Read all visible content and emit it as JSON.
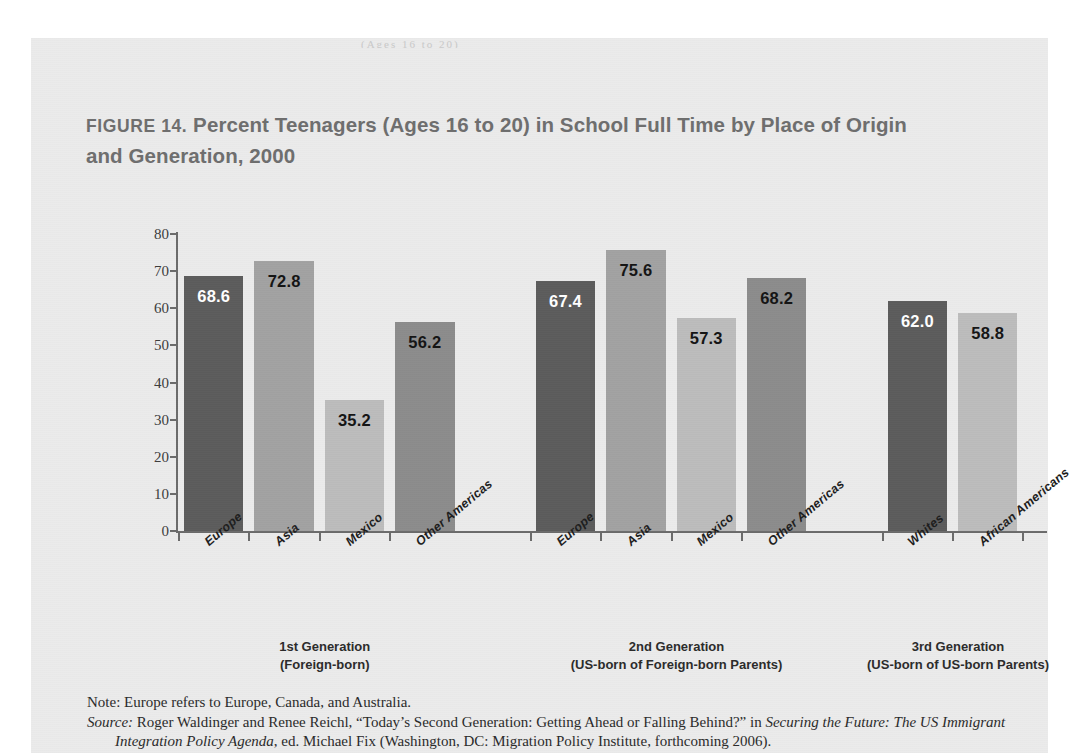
{
  "page": {
    "top_sliver_text": "(Ages 16 to 20)"
  },
  "figure": {
    "label": "FIGURE 14.",
    "title_rest": " Percent Teenagers (Ages 16 to 20) in School Full Time by Place of Origin and Generation, 2000",
    "title_full": "FIGURE 14. Percent Teenagers (Ages 16 to 20) in School Full Time by Place of Origin and Generation, 2000"
  },
  "notes": {
    "note_label": "Note:",
    "note_text": " Europe refers to Europe, Canada, and Australia.",
    "source_label": "Source:",
    "source_text_1": " Roger Waldinger and Renee Reichl, “Today’s Second Generation: Getting Ahead or Falling Behind?” in ",
    "source_italic": "Securing the Future: The US Immigrant Integration Policy Agenda",
    "source_text_2": ", ed. Michael Fix (Washington, DC: Migration Policy Institute, forthcoming 2006)."
  },
  "colors": {
    "bar_dark": "#5c5c5c",
    "bar_mid": "#8c8c8c",
    "bar_light_mid": "#a2a2a2",
    "bar_light": "#bcbcbc",
    "axis": "#6b6b6b",
    "title": "#6e6e6e",
    "label_on_dark": "#ffffff",
    "label_on_light": "#141414",
    "page_bg": "#ebebeb"
  },
  "chart_data": {
    "type": "bar",
    "title": "FIGURE 14. Percent Teenagers (Ages 16 to 20) in School Full Time by Place of Origin and Generation, 2000",
    "xlabel": "",
    "ylabel": "",
    "ylim": [
      0,
      80
    ],
    "yticks": [
      0,
      10,
      20,
      30,
      40,
      50,
      60,
      70,
      80
    ],
    "grid": false,
    "legend": "none",
    "categories": [
      "Europe",
      "Asia",
      "Mexico",
      "Other Americas",
      "Europe",
      "Asia",
      "Mexico",
      "Other Americas",
      "Whites",
      "African Americans"
    ],
    "values": [
      68.6,
      72.8,
      35.2,
      56.2,
      67.4,
      75.6,
      57.3,
      68.2,
      62.0,
      58.8
    ],
    "value_labels": [
      "68.6",
      "72.8",
      "35.2",
      "56.2",
      "67.4",
      "75.6",
      "57.3",
      "68.2",
      "62.0",
      "58.8"
    ],
    "bar_colors": [
      "#5c5c5c",
      "#a2a2a2",
      "#bcbcbc",
      "#8c8c8c",
      "#5c5c5c",
      "#a2a2a2",
      "#bcbcbc",
      "#8c8c8c",
      "#5c5c5c",
      "#bcbcbc"
    ],
    "label_colors": [
      "#ffffff",
      "#141414",
      "#141414",
      "#141414",
      "#ffffff",
      "#141414",
      "#141414",
      "#141414",
      "#ffffff",
      "#141414"
    ],
    "groups": [
      {
        "line1": "1st Generation",
        "line2": "(Foreign-born)",
        "members": [
          "Europe",
          "Asia",
          "Mexico",
          "Other Americas"
        ]
      },
      {
        "line1": "2nd Generation",
        "line2": "(US-born of Foreign-born Parents)",
        "members": [
          "Europe",
          "Asia",
          "Mexico",
          "Other Americas"
        ]
      },
      {
        "line1": "3rd Generation",
        "line2": "(US-born of US-born Parents)",
        "members": [
          "Whites",
          "African Americans"
        ]
      }
    ]
  }
}
